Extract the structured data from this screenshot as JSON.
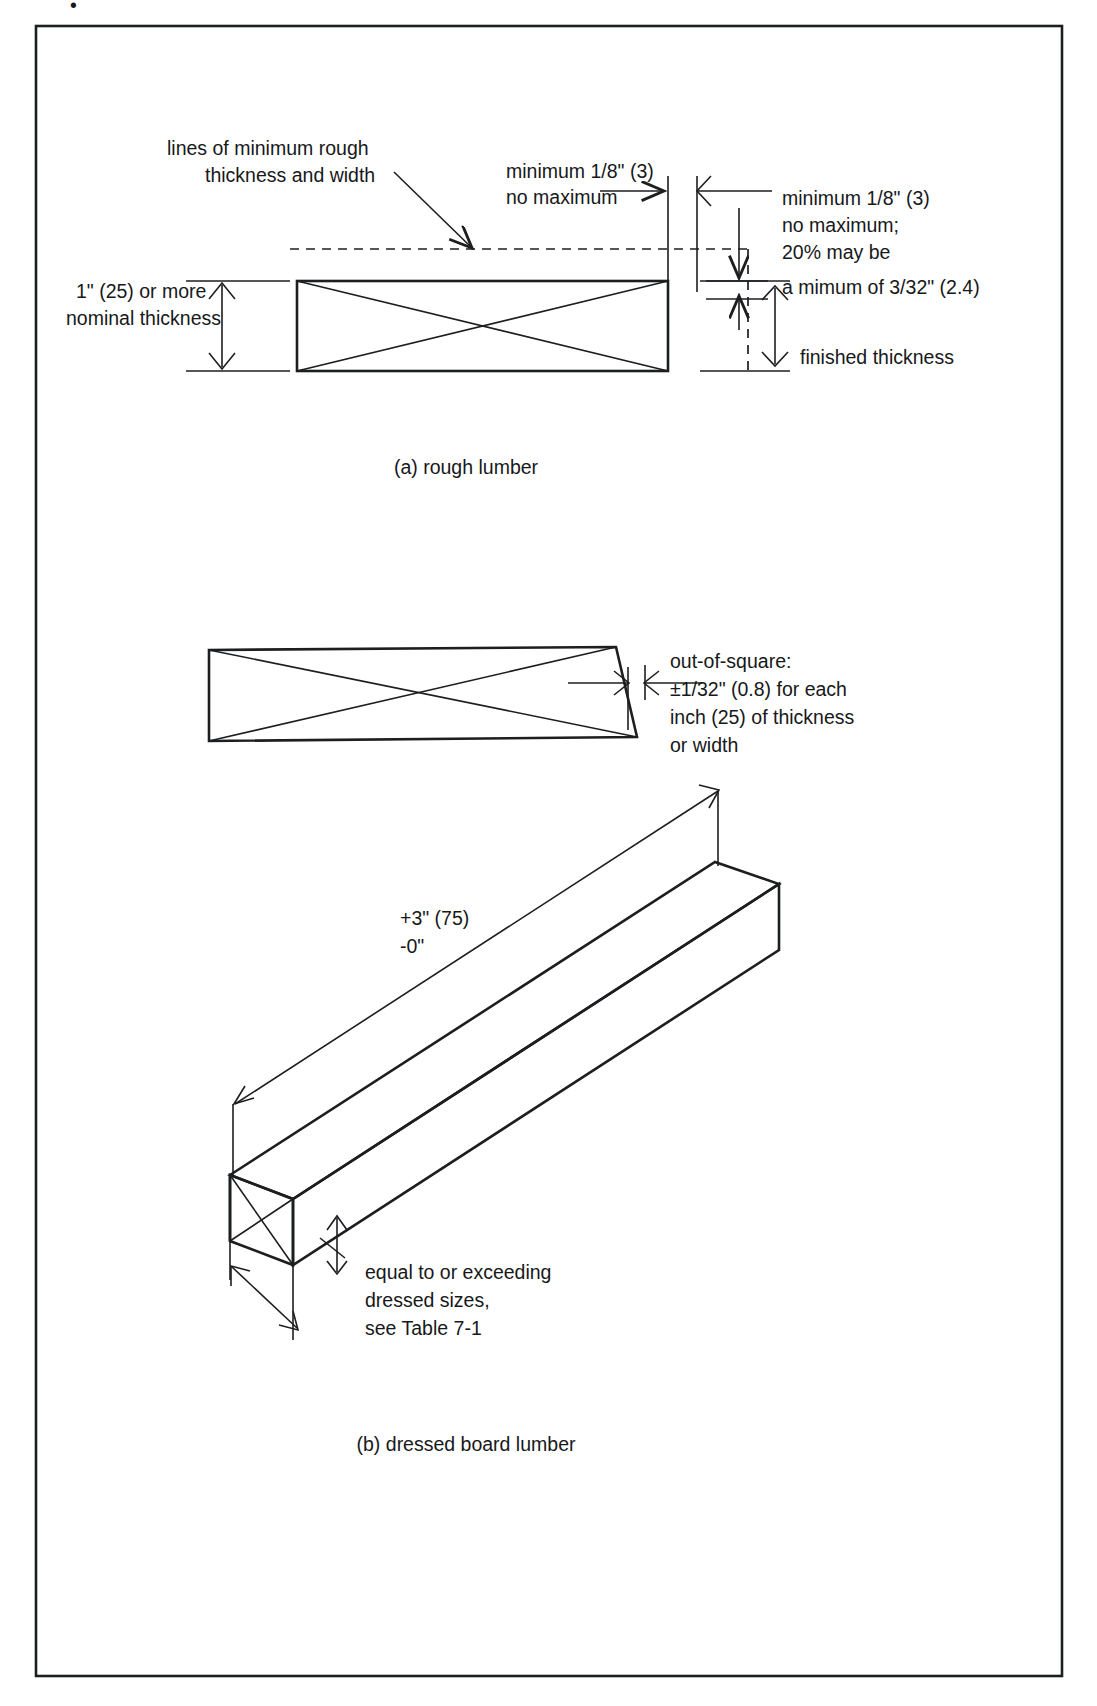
{
  "figure": {
    "title_fragment": "•",
    "panels": [
      {
        "id": "a",
        "caption": "(a) rough lumber"
      },
      {
        "id": "b",
        "caption": "(b) dressed board lumber"
      }
    ]
  },
  "panel_a": {
    "callout_lines_label": {
      "line1": "lines of minimum rough",
      "line2": "thickness and width"
    },
    "top_gap_label": {
      "line1": "minimum 1/8\" (3)",
      "line2": "no maximum"
    },
    "right_label": {
      "line1": "minimum 1/8\" (3)",
      "line2": "no maximum;",
      "line3": "20% may be",
      "line4": "a mimum of 3/32\" (2.4)"
    },
    "left_label": {
      "line1": "1\" (25) or more",
      "line2": "nominal thickness"
    },
    "finished_label": "finished thickness"
  },
  "panel_square": {
    "label": {
      "line1": "out-of-square:",
      "line2": "±1/32\" (0.8) for each",
      "line3": "inch (25) of thickness",
      "line4": "or width"
    }
  },
  "panel_b": {
    "length_tolerance": {
      "line1": "+3\" (75)",
      "line2": "-0\""
    },
    "size_label": {
      "line1": "equal to or exceeding",
      "line2": "dressed sizes,",
      "line3": "see Table 7-1"
    }
  },
  "colors": {
    "ink": "#1d1e20",
    "text": "#17181a",
    "background": "#ffffff"
  }
}
